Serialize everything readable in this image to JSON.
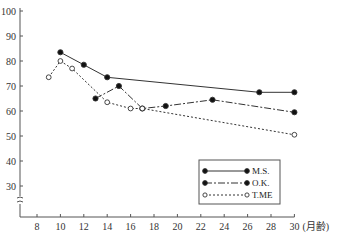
{
  "chart_data": {
    "type": "line",
    "title": "",
    "xlabel": "(月齢)",
    "ylabel": "",
    "xlim": [
      7,
      30
    ],
    "ylim": [
      20,
      100
    ],
    "x_ticks": [
      8,
      10,
      12,
      14,
      16,
      18,
      20,
      22,
      24,
      26,
      28,
      30
    ],
    "y_ticks": [
      30,
      40,
      50,
      60,
      70,
      80,
      90,
      100
    ],
    "y_axis_break": true,
    "grid": false,
    "legend_position": "lower right",
    "series": [
      {
        "name": "M.S.",
        "line_style": "solid",
        "marker": "filled-circle",
        "x": [
          10,
          12,
          14,
          27,
          30
        ],
        "y": [
          83.5,
          78.5,
          73.5,
          67.5,
          67.5
        ]
      },
      {
        "name": "O.K.",
        "line_style": "dash-dot",
        "marker": "filled-circle",
        "x": [
          13,
          15,
          17,
          19,
          23,
          30
        ],
        "y": [
          65,
          70,
          61,
          62,
          64.5,
          59.5
        ]
      },
      {
        "name": "T.ME",
        "line_style": "dotted",
        "marker": "open-circle",
        "x": [
          9,
          10,
          11,
          14,
          16,
          17,
          30
        ],
        "y": [
          73.5,
          80,
          77,
          63.5,
          61,
          61,
          50.5
        ]
      }
    ]
  },
  "legend": {
    "items": [
      {
        "label": "M.S."
      },
      {
        "label": "O.K."
      },
      {
        "label": "T.ME"
      }
    ]
  },
  "axis": {
    "x_unit_label": "(月齢)"
  }
}
